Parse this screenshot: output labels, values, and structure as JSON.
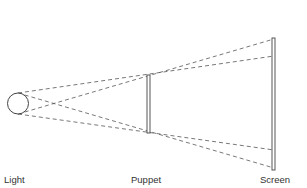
{
  "diagram": {
    "type": "shadow-projection",
    "colors": {
      "stroke": "#444444",
      "ray": "#555555",
      "text": "#333333",
      "background": "#ffffff"
    },
    "labels": {
      "light": "Light",
      "puppet": "Puppet",
      "screen": "Screen"
    },
    "light": {
      "cx": 18,
      "cy": 103.5,
      "r": 10.5
    },
    "puppet": {
      "x": 147,
      "y": 75,
      "width": 3,
      "height": 58
    },
    "screen": {
      "x": 272,
      "y": 38,
      "width": 3,
      "height": 132
    },
    "rays": [
      {
        "from": [
          18,
          93
        ],
        "to": [
          274,
          56
        ]
      },
      {
        "from": [
          18,
          114
        ],
        "to": [
          274,
          39
        ]
      },
      {
        "from": [
          18,
          93
        ],
        "to": [
          274,
          168
        ]
      },
      {
        "from": [
          18,
          114
        ],
        "to": [
          274,
          150
        ]
      }
    ]
  }
}
